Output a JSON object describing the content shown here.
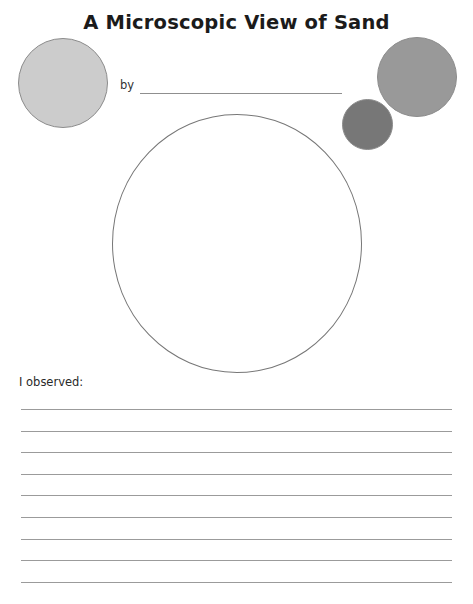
{
  "page": {
    "title": "A Microscopic View of Sand",
    "width": 473,
    "height": 604,
    "background": "#ffffff"
  },
  "byline": {
    "label": "by",
    "value": "",
    "placeholder": ""
  },
  "prompt": {
    "observed_label": "I observed:"
  },
  "observation_area": {
    "name": "drawing-circle",
    "value": "",
    "outline_color": "#777777"
  },
  "decorations": {
    "grains": [
      {
        "name": "sand-grain-top-left",
        "fill": "#cccccc",
        "stroke": "#8c8c8c",
        "size": 90
      },
      {
        "name": "sand-grain-top-right-large",
        "fill": "#999999",
        "stroke": "#8c8c8c",
        "size": 80
      },
      {
        "name": "sand-grain-top-right-small",
        "fill": "#777777",
        "stroke": "#8c8c8c",
        "size": 51
      }
    ]
  },
  "writing_lines": {
    "count": 9,
    "color": "#9b9b9b",
    "values": [
      "",
      "",
      "",
      "",
      "",
      "",
      "",
      "",
      ""
    ]
  }
}
